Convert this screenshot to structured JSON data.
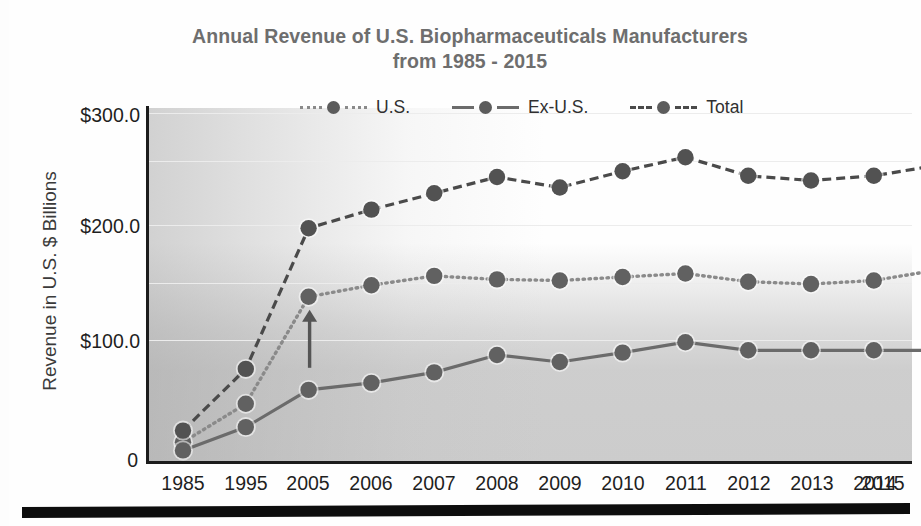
{
  "chart_data": {
    "type": "line",
    "title": "Annual Revenue of U.S. Biopharmaceuticals Manufacturers from 1985 - 2015",
    "title_line1": "Annual Revenue of U.S. Biopharmaceuticals Manufacturers",
    "title_line2": "from 1985 - 2015",
    "xlabel": "",
    "ylabel": "Revenue in U.S. $ Billions",
    "categories": [
      "1985",
      "1995",
      "2005",
      "2006",
      "2007",
      "2008",
      "2009",
      "2010",
      "2011",
      "2012",
      "2013",
      "2014",
      "2015"
    ],
    "ylim": [
      0,
      320
    ],
    "yticks": [
      0,
      100,
      200,
      300
    ],
    "ytick_labels": [
      "0",
      "$100.0",
      "$200.0",
      "$300.0"
    ],
    "grid": true,
    "grid_axis": "y",
    "legend_position": "top-center",
    "series": [
      {
        "name": "U.S.",
        "style": "dotted",
        "color": "#8a8a8a",
        "marker_color": "#616161",
        "values": [
          17,
          50,
          142,
          152,
          160,
          157,
          156,
          159,
          162,
          155,
          153,
          156,
          165
        ]
      },
      {
        "name": "Ex-U.S.",
        "style": "solid",
        "color": "#6b6b6b",
        "marker_color": "#616161",
        "values": [
          10,
          30,
          62,
          68,
          77,
          92,
          86,
          94,
          103,
          96,
          96,
          96,
          96
        ]
      },
      {
        "name": "Total",
        "style": "dashed",
        "color": "#4a4a4a",
        "marker_color": "#525252",
        "values": [
          27,
          80,
          201,
          217,
          231,
          245,
          236,
          250,
          262,
          246,
          242,
          246,
          255
        ]
      }
    ],
    "annotations": [
      {
        "type": "arrow",
        "name": "up-arrow-annotation",
        "points_to_category": "2005",
        "points_to_series": "U.S.",
        "direction": "up"
      }
    ]
  },
  "colors": {
    "title": "#6e6e6e",
    "axis": "#1c1c1c",
    "grid": "#ececec",
    "text": "#1f1f1f",
    "marker": "#5c5c5c"
  }
}
